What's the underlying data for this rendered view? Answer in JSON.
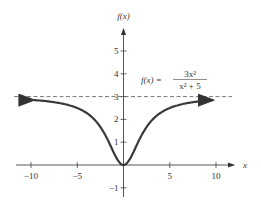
{
  "chart_data": {
    "type": "line",
    "title": "",
    "function_label": "f(x) = 3x^2 / (x^2 + 5)",
    "formula": {
      "lhs": "f(x) =",
      "numerator": "3x²",
      "denominator": "x² + 5"
    },
    "xlabel": "x",
    "ylabel": "f(x)",
    "xlim": [
      -11.5,
      11.5
    ],
    "ylim": [
      -1.4,
      6
    ],
    "x_ticks": [
      -10,
      -5,
      5,
      10
    ],
    "x_tick_labels": [
      "−10",
      "−5",
      "5",
      "10"
    ],
    "y_ticks": [
      -1,
      1,
      2,
      3,
      4,
      5
    ],
    "y_tick_labels": [
      "−1",
      "1",
      "2",
      "3",
      "4",
      "5"
    ],
    "asymptote": {
      "type": "horizontal",
      "y": 3,
      "style": "dashed"
    },
    "series": [
      {
        "name": "f(x)",
        "x": [
          -10,
          -8,
          -6,
          -4,
          -3,
          -2,
          -1,
          0,
          1,
          2,
          3,
          4,
          6,
          8,
          10
        ],
        "values": [
          2.86,
          2.78,
          2.59,
          2.29,
          1.93,
          1.33,
          0.5,
          0,
          0.5,
          1.33,
          1.93,
          2.29,
          2.59,
          2.78,
          2.86
        ]
      }
    ],
    "grid": false,
    "legend": "none"
  }
}
